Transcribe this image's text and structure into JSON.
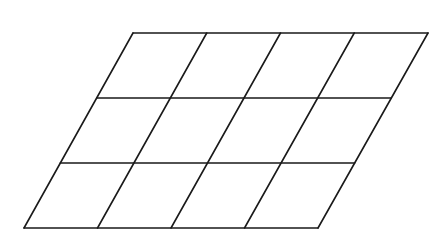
{
  "diagram": {
    "type": "subdivided-parallelogram",
    "columns": 4,
    "rows": 3,
    "stroke_color": "#1a1a1a",
    "background_color": "#ffffff",
    "stroke_width": 1.6,
    "corners": {
      "top_left": [
        133,
        33
      ],
      "top_right": [
        428,
        33
      ],
      "bottom_right": [
        318,
        228
      ],
      "bottom_left": [
        24,
        228
      ]
    }
  }
}
